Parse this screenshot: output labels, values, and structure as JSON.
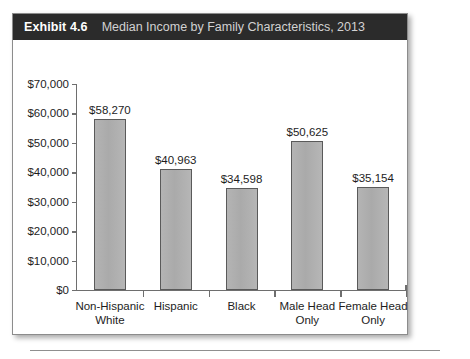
{
  "exhibit": {
    "number": "Exhibit 4.6",
    "title": "Median Income by Family Characteristics, 2013"
  },
  "chart_data": {
    "type": "bar",
    "title": "Median Income by Family Characteristics, 2013",
    "xlabel": "",
    "ylabel": "",
    "ylim": [
      0,
      70000
    ],
    "grid": false,
    "legend": false,
    "categories": [
      "Non-Hispanic White",
      "Hispanic",
      "Black",
      "Male Head Only",
      "Female Head Only"
    ],
    "category_lines": [
      [
        "Non-Hispanic",
        "White"
      ],
      [
        "Hispanic",
        ""
      ],
      [
        "Black",
        ""
      ],
      [
        "Male Head",
        "Only"
      ],
      [
        "Female Head",
        "Only"
      ]
    ],
    "values": [
      58270,
      40963,
      34598,
      50625,
      35154
    ],
    "value_labels": [
      "$58,270",
      "$40,963",
      "$34,598",
      "$50,625",
      "$35,154"
    ],
    "ytick_values": [
      0,
      10000,
      20000,
      30000,
      40000,
      50000,
      60000,
      70000
    ],
    "ytick_labels": [
      "$0",
      "$10,000",
      "$20,000",
      "$30,000",
      "$40,000",
      "$50,000",
      "$60,000",
      "$70,000"
    ],
    "bar_color": "#aeaeae",
    "bar_border_color": "#5a5a5a",
    "axis_color": "#6e6e6e",
    "text_color": "#1d1d1d"
  },
  "style": {
    "titlebar_bg": "#2b2b2b",
    "titlebar_number_color": "#ffffff",
    "titlebar_title_color": "#d2d2d2",
    "panel_bg": "#ffffff"
  }
}
